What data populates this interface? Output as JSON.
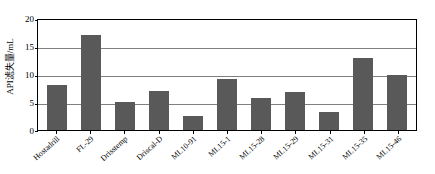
{
  "chart_data": {
    "type": "bar",
    "title": "",
    "xlabel": "",
    "ylabel": "API滤失量/mL",
    "ylim": [
      0,
      20
    ],
    "yticks": [
      0,
      5,
      10,
      15,
      20
    ],
    "ytick_labels": [
      "0",
      "5",
      "10",
      "15",
      "20"
    ],
    "grid": true,
    "legend": "none",
    "bar_color": "#595959",
    "axis_color": "#000000",
    "gridline_color": "#808080",
    "categories": [
      "Hostadrill",
      "FL-29",
      "Drisstemp",
      "Driscal-D",
      "ML10-91",
      "ML15-1",
      "ML15-28",
      "ML15-29",
      "ML15-31",
      "ML15-35",
      "ML15-46"
    ],
    "values": [
      8.0,
      17.0,
      5.0,
      7.0,
      2.5,
      9.1,
      5.8,
      6.7,
      3.3,
      12.8,
      9.8
    ]
  }
}
